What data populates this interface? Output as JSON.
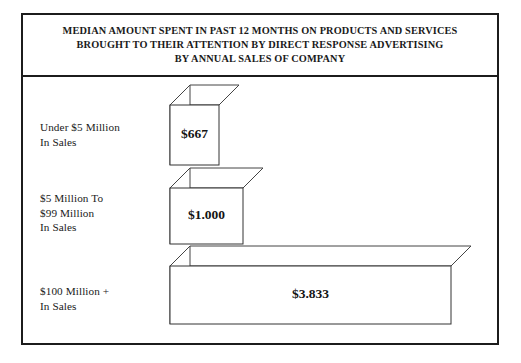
{
  "chart": {
    "title": "MEDIAN AMOUNT SPENT IN PAST 12 MONTHS ON PRODUCTS AND SERVICES\nBROUGHT TO THEIR ATTENTION BY DIRECT RESPONSE ADVERTISING\nBY ANNUAL SALES OF COMPANY",
    "frame_color": "#1c1c1c",
    "bar_fill": "#ffffff",
    "bar_stroke": "#333333"
  },
  "chart_data": {
    "type": "bar",
    "orientation": "horizontal",
    "style": "3d-isometric",
    "title": "MEDIAN AMOUNT SPENT IN PAST 12 MONTHS ON PRODUCTS AND SERVICES BROUGHT TO THEIR ATTENTION BY DIRECT RESPONSE ADVERTISING BY ANNUAL SALES OF COMPANY",
    "xlabel": "",
    "ylabel": "",
    "grid": false,
    "legend": false,
    "categories": [
      "Under $5 Million\nIn Sales",
      "$5 Million To\n$99 Million\nIn Sales",
      "$100 Million +\nIn Sales"
    ],
    "values": [
      667,
      1000,
      3833
    ],
    "value_labels": [
      "$667",
      "$1.000",
      "$3.833"
    ],
    "xlim": [
      0,
      4200
    ]
  }
}
